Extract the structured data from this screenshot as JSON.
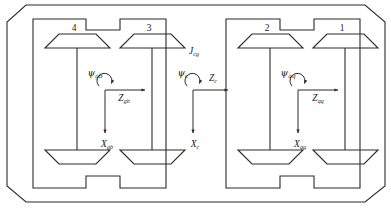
{
  "figure": {
    "type": "engineering-schematic",
    "background_color": "#ffffff",
    "line_color": "#2b2b2b"
  },
  "wheelsets": [
    {
      "id": "wheelset-4",
      "label": "4",
      "position": "rear-bogie-left-top"
    },
    {
      "id": "wheelset-3",
      "label": "3",
      "position": "rear-bogie-right-top"
    },
    {
      "id": "wheelset-2",
      "label": "2",
      "position": "front-bogie-left-top"
    },
    {
      "id": "wheelset-1",
      "label": "1",
      "position": "front-bogie-right-top"
    }
  ],
  "frames": [
    {
      "id": "rear-bogie-frame",
      "yaw_label": "ψ",
      "yaw_sub": "gb",
      "z_label": "Z",
      "z_sub": "gb",
      "x_label": "X",
      "x_sub": "gb"
    },
    {
      "id": "carbody-frame",
      "yaw_label": "ψ",
      "yaw_sub": "c",
      "z_label": "Z",
      "z_sub": "c",
      "x_label": "X",
      "x_sub": "c"
    },
    {
      "id": "front-bogie-frame",
      "yaw_label": "ψ",
      "yaw_sub": "qq",
      "z_label": "Z",
      "z_sub": "qq",
      "x_label": "X",
      "x_sub": "qq"
    }
  ],
  "annotations": [
    {
      "id": "coupling-label",
      "label": "J",
      "sub": "cg"
    }
  ]
}
